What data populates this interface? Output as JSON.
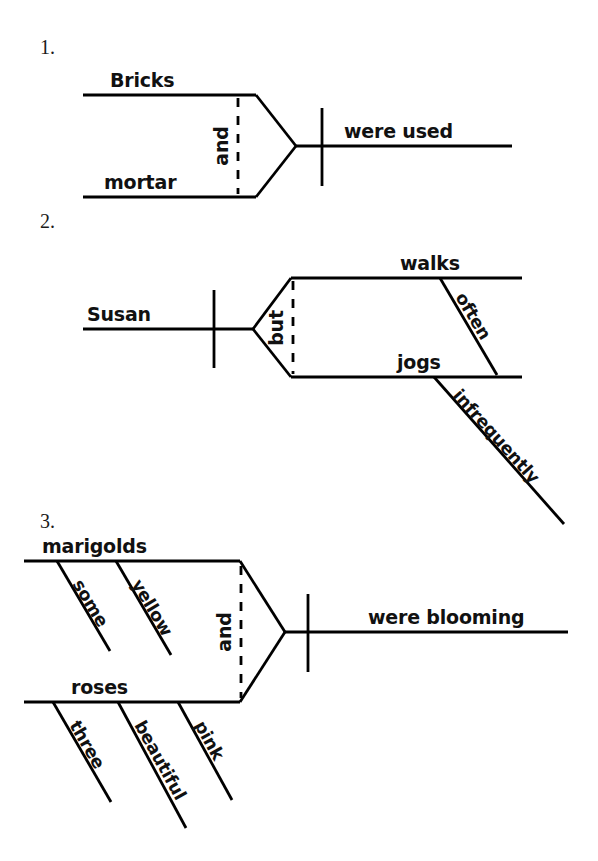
{
  "page": {
    "background_color": "#ffffff",
    "ink_color": "#000000"
  },
  "diagrams": [
    {
      "number": "1.",
      "sentence": "Bricks and mortar were used.",
      "conjunction": "and",
      "conjunction_style": "dashed-vertical",
      "compound_part": "subject",
      "subjects": [
        {
          "word": "Bricks",
          "modifiers": []
        },
        {
          "word": "mortar",
          "modifiers": []
        }
      ],
      "predicate": {
        "word": "were used",
        "modifiers": []
      }
    },
    {
      "number": "2.",
      "sentence": "Susan walks often but jogs infrequently.",
      "conjunction": "but",
      "conjunction_style": "dashed-vertical",
      "compound_part": "predicate",
      "subjects": [
        {
          "word": "Susan",
          "modifiers": []
        }
      ],
      "predicates": [
        {
          "word": "walks",
          "modifiers": [
            {
              "word": "often"
            }
          ]
        },
        {
          "word": "jogs",
          "modifiers": [
            {
              "word": "infrequently"
            }
          ]
        }
      ]
    },
    {
      "number": "3.",
      "sentence": "Some yellow marigolds and three beautiful pink roses were blooming.",
      "conjunction": "and",
      "conjunction_style": "dashed-vertical",
      "compound_part": "subject",
      "subjects": [
        {
          "word": "marigolds",
          "modifiers": [
            {
              "word": "some"
            },
            {
              "word": "yellow"
            }
          ]
        },
        {
          "word": "roses",
          "modifiers": [
            {
              "word": "three"
            },
            {
              "word": "beautiful"
            },
            {
              "word": "pink"
            }
          ]
        }
      ],
      "predicate": {
        "word": "were blooming",
        "modifiers": []
      }
    }
  ],
  "labels": {
    "d1_number": "1.",
    "d1_subject_a": "Bricks",
    "d1_subject_b": "mortar",
    "d1_conjunction": "and",
    "d1_verb": "were used",
    "d2_number": "2.",
    "d2_subject": "Susan",
    "d2_conjunction": "but",
    "d2_verb_a": "walks",
    "d2_verb_a_mod": "often",
    "d2_verb_b": "jogs",
    "d2_verb_b_mod": "infrequently",
    "d3_number": "3.",
    "d3_subject_a": "marigolds",
    "d3_subject_a_mod1": "some",
    "d3_subject_a_mod2": "yellow",
    "d3_conjunction": "and",
    "d3_subject_b": "roses",
    "d3_subject_b_mod1": "three",
    "d3_subject_b_mod2": "beautiful",
    "d3_subject_b_mod3": "pink",
    "d3_verb": "were blooming"
  }
}
